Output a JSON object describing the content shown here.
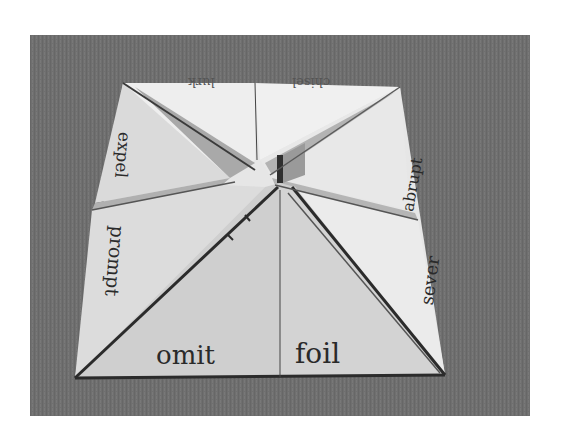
{
  "image": {
    "subject": "paper fortune teller",
    "words": {
      "top_left": "lurk",
      "top_right": "chisel",
      "left_upper": "expel",
      "left_lower": "prompt",
      "right_upper": "abrupt",
      "right_lower": "sever",
      "bottom_left": "omit",
      "bottom_right": "foil"
    }
  },
  "colors": {
    "background": "#6f6f6f",
    "paper_light": "#ececec",
    "paper_mid": "#d4d4d4",
    "paper_shadow": "#a8a8a8",
    "crease": "#2b2b2b"
  }
}
